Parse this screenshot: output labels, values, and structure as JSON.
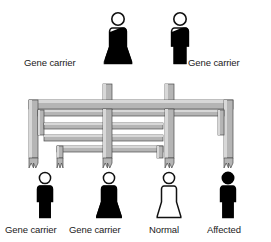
{
  "diagram": {
    "colors": {
      "outline": "#1a1a1a",
      "filled": "#000000",
      "unfilled": "#ffffff",
      "pipe_fill": "#b5b5b5",
      "pipe_highlight": "#d8d8d8",
      "pipe_shadow": "#8c8c8c",
      "text": "#1a1a1a",
      "background": "#ffffff"
    },
    "generations": [
      {
        "name": "parents",
        "figures": [
          {
            "id": "parent-female-carrier",
            "sex": "female",
            "status": "carrier",
            "fill": "half-black",
            "label": "Gene carrier",
            "label_side": "left"
          },
          {
            "id": "parent-male-carrier",
            "sex": "male",
            "status": "carrier",
            "fill": "half-black",
            "label": "Gene carrier",
            "label_side": "right"
          }
        ]
      },
      {
        "name": "children",
        "figures": [
          {
            "id": "child-1-male-carrier",
            "sex": "male",
            "status": "carrier",
            "fill": "half-black",
            "label": "Gene carrier"
          },
          {
            "id": "child-2-female-carrier",
            "sex": "female",
            "status": "carrier",
            "fill": "half-black",
            "label": "Gene carrier"
          },
          {
            "id": "child-3-female-normal",
            "sex": "female",
            "status": "normal",
            "fill": "white",
            "label": "Normal"
          },
          {
            "id": "child-4-male-affected",
            "sex": "male",
            "status": "affected",
            "fill": "black",
            "label": "Affected"
          }
        ]
      }
    ],
    "legend_terms": {
      "carrier": "Gene carrier",
      "normal": "Normal",
      "affected": "Affected"
    }
  }
}
